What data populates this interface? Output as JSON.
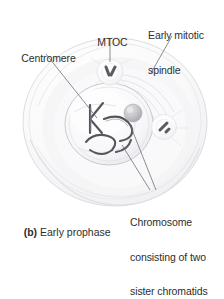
{
  "figure": {
    "caption_tag": "(b)",
    "caption_text": " Early prophase",
    "caption_full": "(b) Early prophase"
  },
  "labels": {
    "centromere": "Centromere",
    "mtoc": "MTOC",
    "spindle_line1": "Early mitotic",
    "spindle_line2": "spindle",
    "chromosome_line1": "Chromosome",
    "chromosome_line2": "consisting of two",
    "chromosome_line3": "sister chromatids"
  },
  "colors": {
    "background": "#ffffff",
    "text": "#2e2e2e",
    "leader_line": "#6e6e75",
    "cell_fill": "#fbfbfc",
    "cell_outline": "#d9dade",
    "cytoplasm_shade": "#f2f2f4",
    "nucleus_fill": "#f7f7f9",
    "nucleus_outline": "#c9cace",
    "chromosome": "#54545a",
    "nucleolus": "#b9babe",
    "centriole": "#5a5a60",
    "spindle_fiber": "#e2e3e6"
  },
  "structures": [
    {
      "name": "plasma-membrane",
      "shape": "large pale circle"
    },
    {
      "name": "cytoplasm",
      "shape": "inner circular shading"
    },
    {
      "name": "nuclear-envelope",
      "shape": "medium circle"
    },
    {
      "name": "chromosomes",
      "count": 3,
      "shape": "dark hooked strands"
    },
    {
      "name": "nucleolus",
      "shape": "small gray sphere"
    },
    {
      "name": "mtoc-top",
      "shape": "pale blob with two centrioles"
    },
    {
      "name": "mtoc-right",
      "shape": "pale blob with centriole"
    },
    {
      "name": "spindle-fibers",
      "shape": "faint concentric arcs"
    }
  ]
}
